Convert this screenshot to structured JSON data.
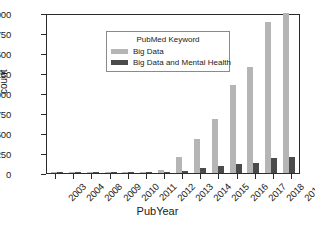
{
  "chart_data": {
    "type": "bar",
    "title": "",
    "xlabel": "PubYear",
    "ylabel": "count",
    "ylim": [
      0,
      2000
    ],
    "yticks": [
      0,
      250,
      500,
      750,
      1000,
      1250,
      1500,
      1750,
      2000
    ],
    "grid": false,
    "legend": {
      "title": "PubMed Keyword",
      "position": "upper left",
      "entries": [
        {
          "name": "Big Data",
          "color": "#b5b5b5"
        },
        {
          "name": "Big Data and Mental Health",
          "color": "#4b4b4b"
        }
      ]
    },
    "categories": [
      "2003",
      "2004",
      "2008",
      "2009",
      "2010",
      "2011",
      "2012",
      "2013",
      "2014",
      "2015",
      "2016",
      "2017",
      "2018",
      "2019"
    ],
    "series": [
      {
        "name": "Big Data",
        "color": "#b5b5b5",
        "values": [
          4,
          2,
          5,
          3,
          4,
          6,
          40,
          200,
          430,
          670,
          1100,
          1330,
          1890,
          2000
        ]
      },
      {
        "name": "Big Data and Mental Health",
        "color": "#4b4b4b",
        "values": [
          2,
          1,
          2,
          1,
          2,
          3,
          18,
          28,
          60,
          85,
          115,
          125,
          190,
          205
        ]
      }
    ]
  },
  "axes": {
    "frame_color": "#2b2b2b"
  }
}
